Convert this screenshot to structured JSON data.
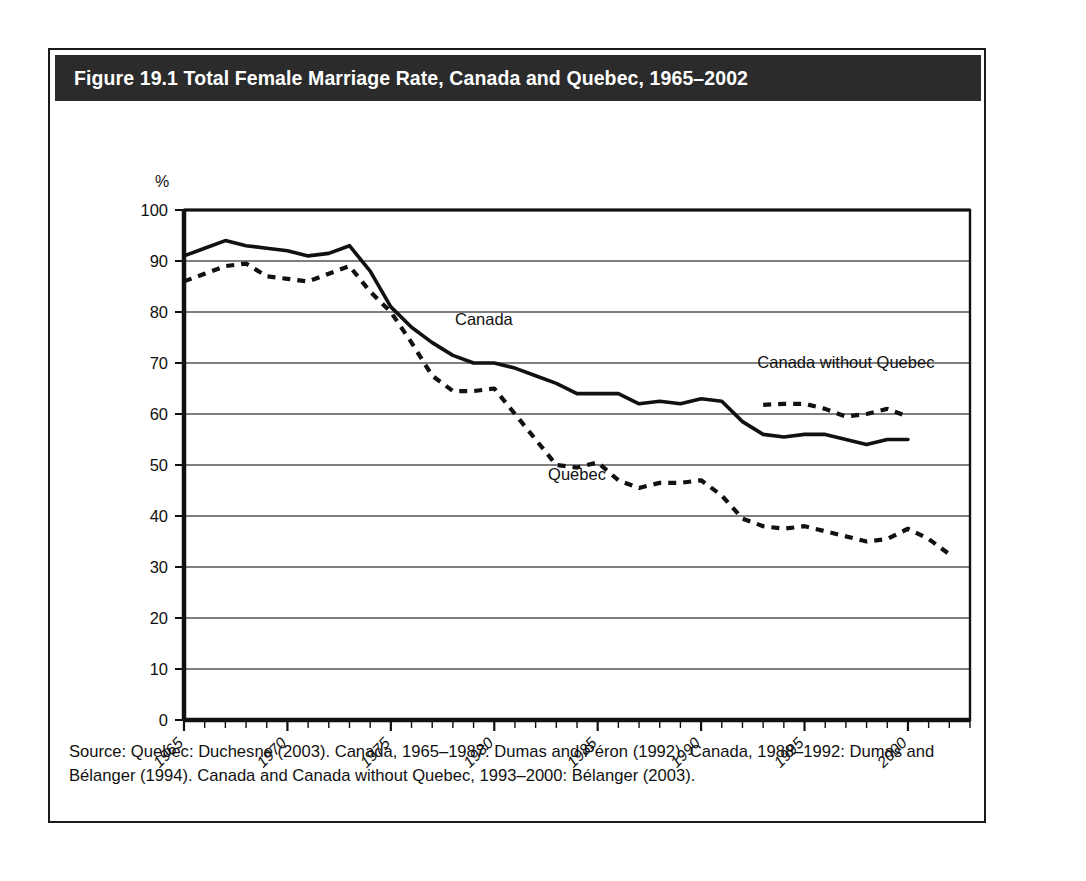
{
  "figure": {
    "title": "Figure 19.1 Total Female Marriage Rate, Canada and Quebec, 1965–2002",
    "source": "Source: Quebec: Duchesne (2003). Canada, 1965–1987: Dumas and Péron (1992). Canada, 1988–1992: Dumas and Bélanger (1994). Canada and Canada without Quebec, 1993–2000: Bélanger (2003)."
  },
  "colors": {
    "title_bar_bg": "#2b2b2b",
    "title_text": "#ffffff",
    "frame_border": "#1a1a1a",
    "axis": "#111111",
    "gridline": "#555555",
    "series_line": "#111111"
  },
  "chart_data": {
    "type": "line",
    "title": "Figure 19.1 Total Female Marriage Rate, Canada and Quebec, 1965–2002",
    "xlabel": "",
    "ylabel": "%",
    "ylim": [
      0,
      100
    ],
    "xlim": [
      1965,
      2002
    ],
    "yticks": [
      "0",
      "10",
      "20",
      "30",
      "40",
      "50",
      "60",
      "70",
      "80",
      "90",
      "100"
    ],
    "xticks": [
      "1965",
      "1970",
      "1975",
      "1980",
      "1985",
      "1990",
      "1995",
      "2000"
    ],
    "xtick_values": [
      1965,
      1970,
      1975,
      1980,
      1985,
      1990,
      1995,
      2000
    ],
    "grid": "horizontal",
    "legend_position": "inline-annotations",
    "annotations": [
      {
        "text": "Canada",
        "x": 1979.5,
        "y": 77.5
      },
      {
        "text": "Quebec",
        "x": 1984.0,
        "y": 47.0
      },
      {
        "text": "Canada without Quebec",
        "x": 1997.0,
        "y": 69.0
      }
    ],
    "series": [
      {
        "name": "Canada",
        "style": "solid",
        "x": [
          1965,
          1966,
          1967,
          1968,
          1969,
          1970,
          1971,
          1972,
          1973,
          1974,
          1975,
          1976,
          1977,
          1978,
          1979,
          1980,
          1981,
          1982,
          1983,
          1984,
          1985,
          1986,
          1987,
          1988,
          1989,
          1990,
          1991,
          1992,
          1993,
          1994,
          1995,
          1996,
          1997,
          1998,
          1999,
          2000
        ],
        "values": [
          91.0,
          92.5,
          94.0,
          93.0,
          92.5,
          92.0,
          91.0,
          91.5,
          93.0,
          88.0,
          81.0,
          77.0,
          74.0,
          71.5,
          70.0,
          70.0,
          69.0,
          67.5,
          66.0,
          64.0,
          64.0,
          64.0,
          62.0,
          62.5,
          62.0,
          63.0,
          62.5,
          58.5,
          56.0,
          55.5,
          56.0,
          56.0,
          55.0,
          54.0,
          55.0,
          55.0
        ]
      },
      {
        "name": "Quebec",
        "style": "dashed",
        "x": [
          1965,
          1966,
          1967,
          1968,
          1969,
          1970,
          1971,
          1972,
          1973,
          1974,
          1975,
          1976,
          1977,
          1978,
          1979,
          1980,
          1981,
          1982,
          1983,
          1984,
          1985,
          1986,
          1987,
          1988,
          1989,
          1990,
          1991,
          1992,
          1993,
          1994,
          1995,
          1996,
          1997,
          1998,
          1999,
          2000,
          2001,
          2002
        ],
        "values": [
          86.0,
          87.5,
          89.0,
          89.5,
          87.0,
          86.5,
          86.0,
          87.5,
          89.0,
          84.0,
          80.0,
          74.0,
          67.5,
          64.5,
          64.5,
          65.0,
          60.0,
          55.0,
          50.0,
          49.5,
          50.5,
          47.0,
          45.5,
          46.5,
          46.5,
          47.0,
          44.0,
          39.5,
          38.0,
          37.5,
          38.0,
          37.0,
          36.0,
          35.0,
          35.5,
          37.5,
          35.5,
          32.5
        ]
      },
      {
        "name": "Canada without Quebec",
        "style": "dashed",
        "x": [
          1993,
          1994,
          1995,
          1996,
          1997,
          1998,
          1999,
          2000
        ],
        "values": [
          61.8,
          62.0,
          62.0,
          61.0,
          59.5,
          60.0,
          61.0,
          59.5
        ]
      }
    ]
  }
}
